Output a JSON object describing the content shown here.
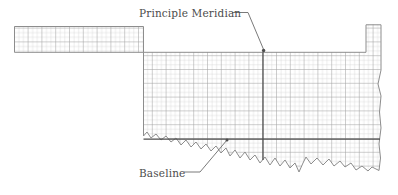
{
  "figure": {
    "kind": "map-diagram",
    "background_color": "#ffffff",
    "grid_color_light": "#d2d2d2",
    "grid_color_dark": "#9a9a9a",
    "outline_color": "#8d8d8d",
    "reference_line_color": "#4d4d4d",
    "leader_color": "#6b6b6b",
    "text_color": "#4c4c4c"
  },
  "labels": {
    "meridian": "Principle Meridian",
    "baseline": "Baseline"
  },
  "reference_lines": {
    "principal_meridian": {
      "orientation": "vertical",
      "x": 263
    },
    "baseline": {
      "orientation": "horizontal",
      "y": 139
    }
  },
  "leaders": {
    "meridian_leader": "elbow line from label to meridian at top of state",
    "baseline_leader": "diagonal line from label up to baseline"
  }
}
